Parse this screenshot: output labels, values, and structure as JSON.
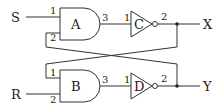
{
  "diagram": {
    "type": "logic-circuit",
    "inputs": [
      {
        "id": "S",
        "label": "S"
      },
      {
        "id": "R",
        "label": "R"
      }
    ],
    "outputs": [
      {
        "id": "X",
        "label": "X"
      },
      {
        "id": "Y",
        "label": "Y"
      }
    ],
    "gates": [
      {
        "id": "A",
        "label": "A",
        "kind": "AND",
        "pins": {
          "in1": "1",
          "in2": "2",
          "out": "3"
        }
      },
      {
        "id": "B",
        "label": "B",
        "kind": "AND",
        "pins": {
          "in1": "1",
          "in2": "2",
          "out": "3"
        }
      },
      {
        "id": "C",
        "label": "C",
        "kind": "NOT",
        "pins": {
          "in": "1",
          "out": "2"
        }
      },
      {
        "id": "D",
        "label": "D",
        "kind": "NOT",
        "pins": {
          "in": "1",
          "out": "2"
        }
      }
    ],
    "connections": [
      "S -> A.1",
      "A.3 -> C.1",
      "C.2 -> X",
      "C.2 -> B.1",
      "R -> B.2",
      "B.3 -> D.1",
      "D.2 -> Y",
      "D.2 -> A.2"
    ]
  }
}
